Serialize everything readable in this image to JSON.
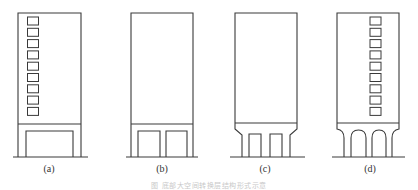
{
  "figure": {
    "panels": [
      {
        "id": "a",
        "label": "(a)",
        "type": "single-large-opening-transfer-beam",
        "windows": 9,
        "window_side": "left"
      },
      {
        "id": "b",
        "label": "(b)",
        "type": "two-openings-transfer-beam",
        "windows": 0
      },
      {
        "id": "c",
        "label": "(c)",
        "type": "chamfered-haunch-transfer",
        "windows": 0
      },
      {
        "id": "d",
        "label": "(d)",
        "type": "arched-transfer",
        "windows": 9,
        "window_side": "right"
      }
    ],
    "caption": "图 底部大空间转换层结构形式示意"
  },
  "colors": {
    "line": "#3a3a3a",
    "background": "#ffffff"
  }
}
